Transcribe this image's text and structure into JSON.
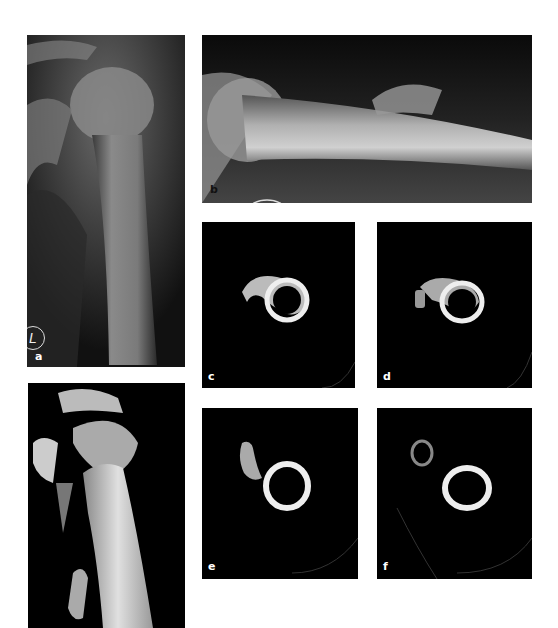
{
  "figure": {
    "panels": [
      {
        "id": "a",
        "label": "a",
        "description": "AP radiograph of left shoulder / proximal humerus",
        "marker": "L"
      },
      {
        "id": "b",
        "label": "b",
        "description": "Lateral radiograph of humerus with fracture fragment"
      },
      {
        "id": "c",
        "label": "c",
        "description": "Axial CT slice of humeral shaft"
      },
      {
        "id": "d",
        "label": "d",
        "description": "Axial CT slice of humeral shaft"
      },
      {
        "id": "e",
        "label": "e",
        "description": "Axial CT slice with displaced fragment"
      },
      {
        "id": "f",
        "label": "f",
        "description": "Axial CT slice with displaced fragment"
      },
      {
        "id": "g",
        "label": "",
        "description": "3D CT reconstruction of proximal humerus"
      }
    ]
  }
}
